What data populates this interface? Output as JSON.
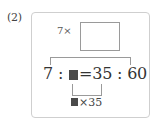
{
  "problem": {
    "label": "(2)",
    "top_multiplier": "7×",
    "answer_box_value": "",
    "equation": {
      "left_term": "7",
      "colon1": ":",
      "unknown_symbol": "■",
      "equals": "=",
      "right_term1": "35",
      "colon2": ":",
      "right_term2": "60"
    },
    "bottom_multiplier": {
      "unknown_symbol": "■",
      "text": "×35"
    }
  },
  "colors": {
    "frame_border": "#cfcfcf",
    "line": "#9a9a9a",
    "filled_square": "#4a4a4a",
    "text": "#333333"
  }
}
